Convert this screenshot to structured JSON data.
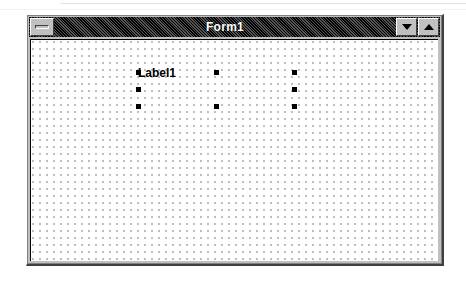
{
  "window": {
    "title": "Form1",
    "sysmenu_icon": "window-menu-bar-icon",
    "minimize_icon": "triangle-down-icon",
    "maximize_icon": "triangle-up-icon",
    "state": "active",
    "title_bar_color": "#000000",
    "title_text_color": "#ffffff",
    "face_color": "#c0c0c0"
  },
  "designer": {
    "surface_background": "#ffffff",
    "grid_dot_color": "#9a9a9a",
    "grid_spacing_px": 7,
    "controls": [
      {
        "type": "label",
        "name": "Label1",
        "caption": "Label1",
        "selected": true,
        "handle_color": "#000000",
        "handles": [
          {
            "name": "handle-top-left",
            "x": 0,
            "y": 0
          },
          {
            "name": "handle-top-center",
            "x": 78,
            "y": 0
          },
          {
            "name": "handle-top-right",
            "x": 156,
            "y": 0
          },
          {
            "name": "handle-middle-left",
            "x": 0,
            "y": 17
          },
          {
            "name": "handle-middle-right",
            "x": 156,
            "y": 17
          },
          {
            "name": "handle-bottom-left",
            "x": 0,
            "y": 34
          },
          {
            "name": "handle-bottom-center",
            "x": 78,
            "y": 34
          },
          {
            "name": "handle-bottom-right",
            "x": 156,
            "y": 34
          }
        ]
      }
    ]
  }
}
